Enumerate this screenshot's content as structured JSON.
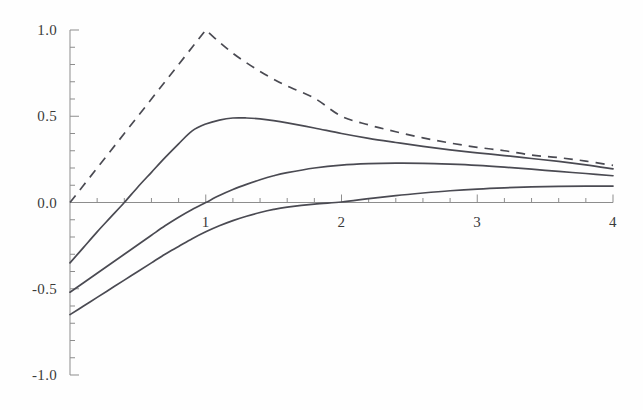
{
  "figure": {
    "title": "",
    "background_color": "#fefefe",
    "curve_color": "#4a4a52",
    "axis_color": "#8d8d8d"
  },
  "axes": {
    "x_tick_labels": [
      "1",
      "2",
      "3",
      "4"
    ],
    "y_tick_labels": [
      "1.0",
      "0.5",
      "0.0",
      "-0.5",
      "-1.0"
    ]
  },
  "chart_data": {
    "type": "line",
    "title": "",
    "xlabel": "",
    "ylabel": "",
    "xlim": [
      0,
      4
    ],
    "ylim": [
      -1.0,
      1.0
    ],
    "grid": false,
    "legend": "none",
    "x_ticks": [
      1,
      2,
      3,
      4
    ],
    "x_tick_labels": [
      "1",
      "2",
      "3",
      "4"
    ],
    "x_minor_ticks": [
      0.2,
      0.4,
      0.6,
      0.8,
      1.2,
      1.4,
      1.6,
      1.8,
      2.2,
      2.4,
      2.6,
      2.8,
      3.2,
      3.4,
      3.6,
      3.8
    ],
    "y_ticks": [
      -1.0,
      -0.5,
      0.0,
      0.5,
      1.0
    ],
    "y_tick_labels": [
      "-1.0",
      "-0.5",
      "0.0",
      "0.5",
      "1.0"
    ],
    "y_minor_ticks": [
      -0.9,
      -0.8,
      -0.7,
      -0.6,
      -0.4,
      -0.3,
      -0.2,
      -0.1,
      0.1,
      0.2,
      0.3,
      0.4,
      0.6,
      0.7,
      0.8,
      0.9
    ],
    "x": [
      0.0,
      0.1,
      0.2,
      0.3,
      0.4,
      0.5,
      0.6,
      0.7,
      0.8,
      0.9,
      1.0,
      1.1,
      1.2,
      1.3,
      1.4,
      1.5,
      1.6,
      1.8,
      2.0,
      2.2,
      2.4,
      2.6,
      2.8,
      3.0,
      3.2,
      3.4,
      3.6,
      3.8,
      4.0
    ],
    "series": [
      {
        "name": "curve-dashed",
        "style": "dashed",
        "color": "#4a4a52",
        "peak_x": 1.0,
        "peak_y": 1.0,
        "values": [
          0.0,
          0.1,
          0.2,
          0.3,
          0.4,
          0.5,
          0.6,
          0.7,
          0.8,
          0.9,
          1.0,
          0.93,
          0.865,
          0.81,
          0.76,
          0.715,
          0.675,
          0.605,
          0.5,
          0.45,
          0.41,
          0.375,
          0.345,
          0.32,
          0.3,
          0.275,
          0.26,
          0.24,
          0.215
        ]
      },
      {
        "name": "curve-solid-upper",
        "style": "solid",
        "color": "#4a4a52",
        "y_at_0": -0.35,
        "zero_crossing_x": 0.7,
        "peak_x": 1.22,
        "peak_y": 0.49,
        "y_at_4": 0.195,
        "values": [
          -0.35,
          -0.26,
          -0.17,
          -0.085,
          0.0,
          0.09,
          0.175,
          0.26,
          0.34,
          0.415,
          0.455,
          0.478,
          0.49,
          0.49,
          0.485,
          0.475,
          0.462,
          0.432,
          0.4,
          0.372,
          0.348,
          0.325,
          0.305,
          0.288,
          0.272,
          0.255,
          0.238,
          0.218,
          0.195
        ]
      },
      {
        "name": "curve-solid-middle",
        "style": "solid",
        "color": "#4a4a52",
        "y_at_0": -0.52,
        "zero_crossing_x": 1.0,
        "peak_x": 2.3,
        "peak_y": 0.228,
        "y_at_4": 0.155,
        "values": [
          -0.52,
          -0.465,
          -0.41,
          -0.355,
          -0.3,
          -0.245,
          -0.19,
          -0.135,
          -0.085,
          -0.04,
          0.0,
          0.04,
          0.075,
          0.105,
          0.132,
          0.155,
          0.173,
          0.2,
          0.217,
          0.225,
          0.228,
          0.227,
          0.222,
          0.215,
          0.205,
          0.193,
          0.18,
          0.168,
          0.155
        ]
      },
      {
        "name": "curve-solid-lower",
        "style": "solid",
        "color": "#4a4a52",
        "y_at_0": -0.65,
        "zero_crossing_x": 2.05,
        "y_at_4": 0.095,
        "values": [
          -0.65,
          -0.6,
          -0.55,
          -0.5,
          -0.45,
          -0.4,
          -0.35,
          -0.3,
          -0.255,
          -0.21,
          -0.17,
          -0.135,
          -0.105,
          -0.08,
          -0.058,
          -0.04,
          -0.027,
          -0.009,
          0.003,
          0.022,
          0.04,
          0.055,
          0.068,
          0.078,
          0.085,
          0.09,
          0.093,
          0.095,
          0.095
        ]
      }
    ]
  }
}
